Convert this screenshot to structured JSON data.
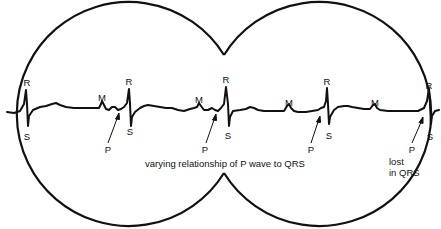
{
  "diagram": {
    "type": "ecg-strip-in-two-circles",
    "caption": "varying relationship of P wave to QRS",
    "note": "lost",
    "note_line2": "in QRS",
    "colors": {
      "stroke": "#111111",
      "background": "#ffffff"
    },
    "circles": [
      {
        "name": "left",
        "cx": 115,
        "cy": 113,
        "r": 112
      },
      {
        "name": "right",
        "cx": 328,
        "cy": 114,
        "r": 112
      }
    ],
    "labels": {
      "r": "R",
      "s": "S",
      "m": "M",
      "p": "P"
    },
    "complexes": [
      {
        "r_label": "R",
        "s_label": "S",
        "x": 26
      },
      {
        "r_label": "R",
        "s_label": "S",
        "x": 129
      },
      {
        "r_label": "R",
        "s_label": "S",
        "x": 227
      },
      {
        "r_label": "R",
        "s_label": "S",
        "x": 327
      },
      {
        "r_label": "R",
        "s_label": "S",
        "x": 429
      }
    ],
    "m_waves": [
      {
        "label": "M",
        "x": 102
      },
      {
        "label": "M",
        "x": 199
      },
      {
        "label": "M",
        "x": 289
      },
      {
        "label": "M",
        "x": 374
      }
    ],
    "p_waves": [
      {
        "label": "P",
        "x": 108,
        "arrow_to_x": 119
      },
      {
        "label": "P",
        "x": 206,
        "arrow_to_x": 216
      },
      {
        "label": "P",
        "x": 311,
        "arrow_to_x": 320
      },
      {
        "label": "P",
        "x": 412,
        "arrow_to_x": 423
      }
    ]
  }
}
